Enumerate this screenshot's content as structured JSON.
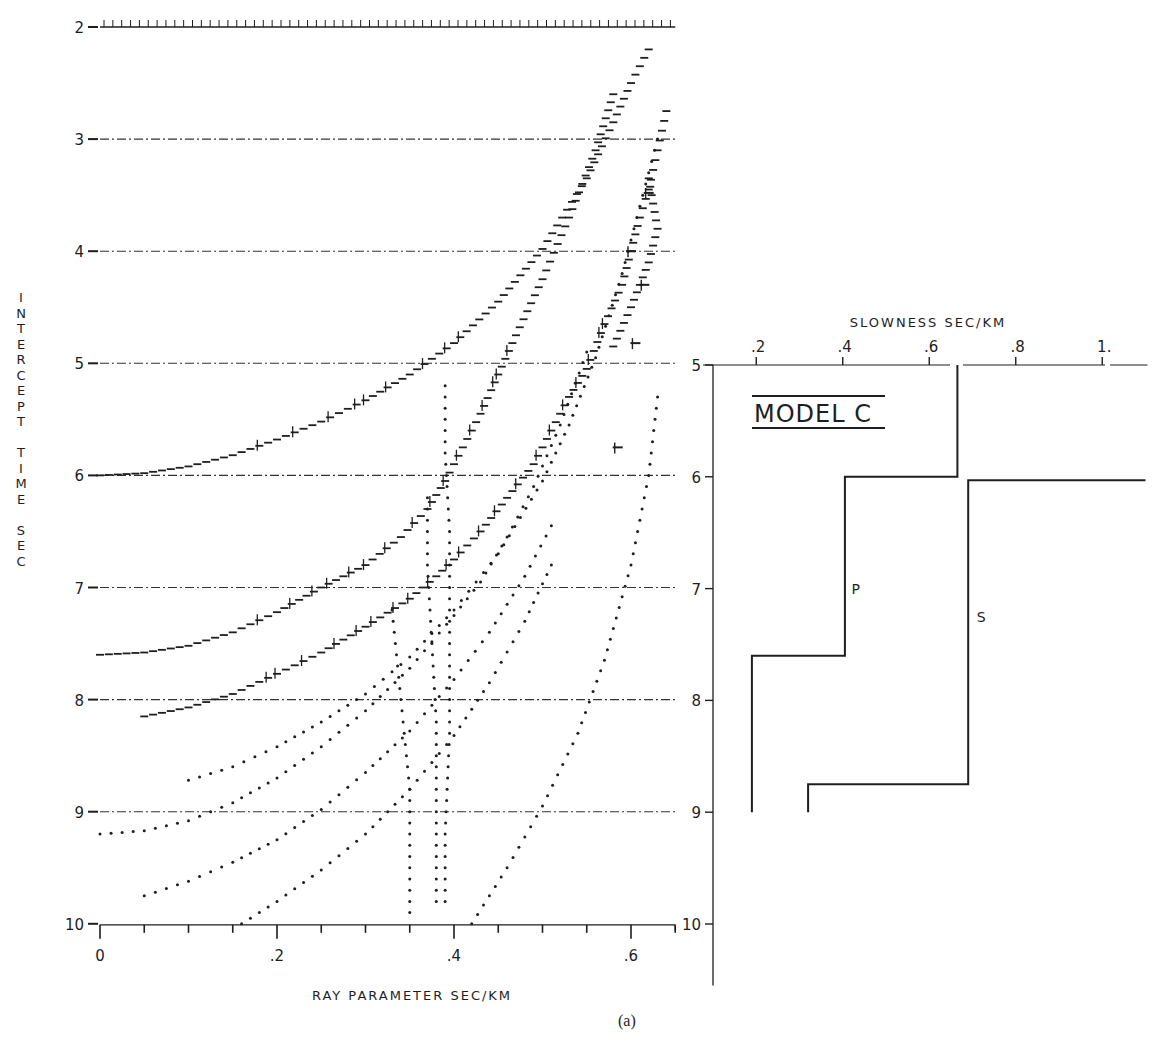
{
  "caption": "(a)",
  "chart_data": [
    {
      "type": "scatter",
      "title": "",
      "xlabel": "RAY PARAMETER SEC/KM",
      "ylabel": "INTERCEPT TIME SEC",
      "xlim": [
        0,
        0.65
      ],
      "ylim": [
        10,
        2
      ],
      "y_inverted": true,
      "grid": "dash-dot horizontal lines at each integer second",
      "x_ticks": [
        0,
        0.2,
        0.4,
        0.6
      ],
      "x_tick_labels": [
        "0",
        ".2",
        ".4",
        ".6"
      ],
      "x_minor_step": 0.05,
      "y_ticks": [
        2,
        3,
        4,
        5,
        6,
        7,
        8,
        9,
        10
      ],
      "y_tick_labels": [
        "2",
        "3",
        "4",
        "5",
        "6",
        "7",
        "8",
        "9",
        "10"
      ],
      "series": [
        {
          "name": "curve-1",
          "style": "ticked",
          "points": [
            [
              0.0,
              6.0
            ],
            [
              0.05,
              5.98
            ],
            [
              0.1,
              5.92
            ],
            [
              0.15,
              5.82
            ],
            [
              0.2,
              5.68
            ],
            [
              0.25,
              5.52
            ],
            [
              0.3,
              5.33
            ],
            [
              0.35,
              5.1
            ],
            [
              0.4,
              4.82
            ],
            [
              0.45,
              4.45
            ],
            [
              0.5,
              3.98
            ],
            [
              0.55,
              3.35
            ],
            [
              0.58,
              2.85
            ],
            [
              0.6,
              2.5
            ],
            [
              0.62,
              2.2
            ]
          ]
        },
        {
          "name": "curve-2",
          "style": "ticked",
          "points": [
            [
              0.0,
              7.6
            ],
            [
              0.05,
              7.58
            ],
            [
              0.1,
              7.52
            ],
            [
              0.15,
              7.4
            ],
            [
              0.2,
              7.22
            ],
            [
              0.25,
              7.0
            ],
            [
              0.3,
              6.8
            ],
            [
              0.34,
              6.55
            ],
            [
              0.37,
              6.3
            ],
            [
              0.39,
              6.05
            ],
            [
              0.41,
              5.75
            ],
            [
              0.43,
              5.45
            ],
            [
              0.45,
              5.1
            ],
            [
              0.47,
              4.75
            ],
            [
              0.5,
              4.25
            ],
            [
              0.53,
              3.7
            ],
            [
              0.56,
              3.1
            ],
            [
              0.58,
              2.6
            ]
          ]
        },
        {
          "name": "curve-3",
          "style": "ticked",
          "points": [
            [
              0.05,
              8.15
            ],
            [
              0.1,
              8.07
            ],
            [
              0.15,
              7.95
            ],
            [
              0.2,
              7.77
            ],
            [
              0.25,
              7.58
            ],
            [
              0.3,
              7.35
            ],
            [
              0.35,
              7.1
            ],
            [
              0.38,
              6.9
            ],
            [
              0.4,
              6.75
            ],
            [
              0.43,
              6.5
            ],
            [
              0.46,
              6.2
            ],
            [
              0.49,
              5.9
            ],
            [
              0.51,
              5.6
            ],
            [
              0.53,
              5.3
            ],
            [
              0.55,
              5.05
            ],
            [
              0.57,
              4.65
            ],
            [
              0.59,
              4.3
            ],
            [
              0.6,
              4.0
            ],
            [
              0.61,
              3.7
            ],
            [
              0.62,
              3.45
            ],
            [
              0.63,
              3.1
            ],
            [
              0.64,
              2.75
            ]
          ]
        },
        {
          "name": "curve-4",
          "style": "dotted",
          "points": [
            [
              0.1,
              8.72
            ],
            [
              0.15,
              8.6
            ],
            [
              0.2,
              8.42
            ],
            [
              0.25,
              8.2
            ],
            [
              0.3,
              7.95
            ],
            [
              0.35,
              7.62
            ],
            [
              0.4,
              7.2
            ],
            [
              0.45,
              6.7
            ],
            [
              0.5,
              6.05
            ],
            [
              0.53,
              5.55
            ],
            [
              0.56,
              4.95
            ],
            [
              0.59,
              4.2
            ],
            [
              0.61,
              3.6
            ],
            [
              0.63,
              3.0
            ]
          ]
        },
        {
          "name": "curve-5",
          "style": "dotted",
          "points": [
            [
              0.0,
              9.2
            ],
            [
              0.05,
              9.17
            ],
            [
              0.1,
              9.08
            ],
            [
              0.15,
              8.92
            ],
            [
              0.2,
              8.7
            ],
            [
              0.25,
              8.42
            ],
            [
              0.3,
              8.1
            ],
            [
              0.35,
              7.72
            ],
            [
              0.4,
              7.25
            ],
            [
              0.43,
              6.95
            ],
            [
              0.46,
              6.55
            ],
            [
              0.49,
              6.1
            ],
            [
              0.52,
              5.55
            ],
            [
              0.55,
              4.9
            ]
          ]
        },
        {
          "name": "curve-6",
          "style": "dotted",
          "points": [
            [
              0.05,
              9.75
            ],
            [
              0.1,
              9.62
            ],
            [
              0.15,
              9.45
            ],
            [
              0.2,
              9.25
            ],
            [
              0.25,
              8.98
            ],
            [
              0.3,
              8.65
            ],
            [
              0.35,
              8.28
            ],
            [
              0.4,
              7.82
            ],
            [
              0.44,
              7.4
            ],
            [
              0.48,
              6.9
            ],
            [
              0.51,
              6.45
            ]
          ]
        },
        {
          "name": "curve-7",
          "style": "dotted",
          "points": [
            [
              0.16,
              10.0
            ],
            [
              0.2,
              9.8
            ],
            [
              0.25,
              9.52
            ],
            [
              0.3,
              9.2
            ],
            [
              0.35,
              8.8
            ],
            [
              0.4,
              8.32
            ],
            [
              0.44,
              7.85
            ],
            [
              0.48,
              7.3
            ],
            [
              0.51,
              6.8
            ]
          ]
        },
        {
          "name": "curve-8",
          "style": "dotted",
          "points": [
            [
              0.42,
              10.0
            ],
            [
              0.46,
              9.5
            ],
            [
              0.5,
              8.95
            ],
            [
              0.54,
              8.3
            ],
            [
              0.57,
              7.65
            ],
            [
              0.6,
              6.8
            ],
            [
              0.62,
              6.0
            ],
            [
              0.63,
              5.3
            ]
          ]
        },
        {
          "name": "curve-9",
          "style": "ticked",
          "points": [
            [
              0.62,
              3.35
            ],
            [
              0.63,
              3.8
            ],
            [
              0.62,
              4.1
            ],
            [
              0.61,
              4.3
            ],
            [
              0.6,
              4.5
            ],
            [
              0.58,
              4.85
            ]
          ]
        },
        {
          "name": "scatter-column-1",
          "style": "dotted",
          "points": [
            [
              0.33,
              7.2
            ],
            [
              0.335,
              7.6
            ],
            [
              0.34,
              8.0
            ],
            [
              0.345,
              8.4
            ],
            [
              0.35,
              8.8
            ],
            [
              0.35,
              9.2
            ],
            [
              0.35,
              9.6
            ],
            [
              0.35,
              9.9
            ]
          ]
        },
        {
          "name": "scatter-column-2",
          "style": "dotted",
          "points": [
            [
              0.37,
              6.2
            ],
            [
              0.37,
              6.8
            ],
            [
              0.375,
              7.5
            ],
            [
              0.38,
              8.2
            ],
            [
              0.38,
              8.9
            ],
            [
              0.38,
              9.5
            ],
            [
              0.38,
              9.8
            ]
          ]
        },
        {
          "name": "scatter-column-3",
          "style": "dotted",
          "points": [
            [
              0.39,
              5.2
            ],
            [
              0.39,
              5.8
            ],
            [
              0.395,
              6.5
            ],
            [
              0.395,
              7.4
            ],
            [
              0.395,
              8.3
            ],
            [
              0.39,
              9.2
            ],
            [
              0.39,
              9.8
            ]
          ]
        }
      ]
    },
    {
      "type": "line",
      "title": "MODEL C",
      "xlabel": "SLOWNESS SEC/KM",
      "ylabel": "",
      "xlim": [
        0.1,
        1.1
      ],
      "ylim": [
        10.5,
        5
      ],
      "y_inverted": true,
      "x_ticks": [
        0.2,
        0.4,
        0.6,
        0.8,
        1.0
      ],
      "x_tick_labels": [
        ".2",
        ".4",
        ".6",
        ".8",
        "1."
      ],
      "y_ticks": [
        5,
        6,
        7,
        8,
        9,
        10
      ],
      "y_tick_labels": [
        "5",
        "6",
        "7",
        "8",
        "9",
        "10"
      ],
      "series": [
        {
          "name": "P",
          "label_at": [
            0.42,
            7.05
          ],
          "points": [
            [
              0.19,
              9.0
            ],
            [
              0.19,
              7.6
            ],
            [
              0.405,
              7.6
            ],
            [
              0.405,
              6.0
            ],
            [
              0.665,
              6.0
            ],
            [
              0.665,
              5.0
            ]
          ]
        },
        {
          "name": "S",
          "label_at": [
            0.71,
            7.3
          ],
          "points": [
            [
              0.32,
              9.0
            ],
            [
              0.32,
              8.75
            ],
            [
              0.69,
              8.75
            ],
            [
              0.69,
              6.03
            ],
            [
              1.1,
              6.03
            ]
          ]
        }
      ]
    }
  ]
}
